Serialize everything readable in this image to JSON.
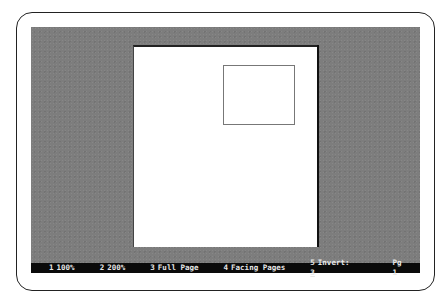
{
  "preview": {
    "background_color": "#7d7d7d",
    "page_color": "#ffffff"
  },
  "statusbar": {
    "items": [
      {
        "key": "1",
        "label": "100%"
      },
      {
        "key": "2",
        "label": "200%"
      },
      {
        "key": "3",
        "label": "Full Page"
      },
      {
        "key": "4",
        "label": "Facing Pages"
      },
      {
        "key": "5",
        "label": "Invert:"
      }
    ],
    "invert_value": "3",
    "page_label": "Pg",
    "page_number": "1"
  }
}
